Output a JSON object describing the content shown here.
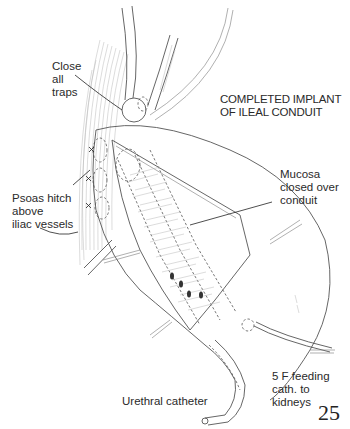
{
  "figure": {
    "title_line1": "COMPLETED IMPLANT",
    "title_line2": "OF ILEAL CONDUIT",
    "page_number": "25"
  },
  "labels": {
    "close_traps": [
      "Close",
      "all",
      "traps"
    ],
    "psoas_hitch": [
      "Psoas hitch",
      "above",
      "iliac vessels"
    ],
    "mucosa": [
      "Mucosa",
      "closed over",
      "conduit"
    ],
    "urethral_catheter": "Urethral catheter",
    "feeding_cath": [
      "5 F feeding",
      "cath. to",
      "kidneys"
    ]
  },
  "icons": {
    "arrow": "arrow-pointer",
    "suture": "cross-stitch"
  },
  "colors": {
    "ink": "#2a2a2a",
    "line": "#555555",
    "hatch": "#b8b8b8",
    "background": "#ffffff"
  }
}
